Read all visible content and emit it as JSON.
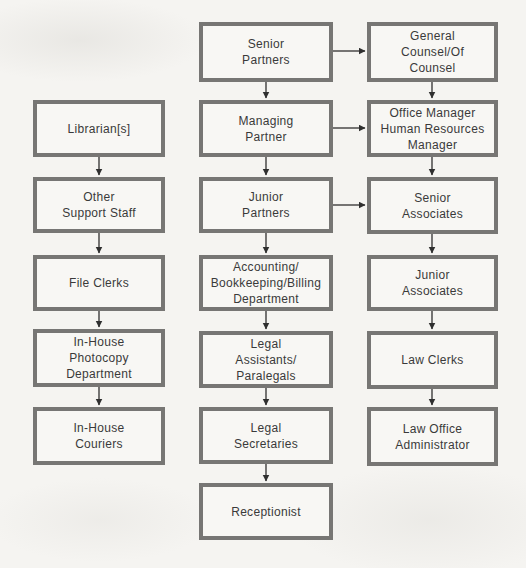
{
  "diagram": {
    "type": "org-chart",
    "colors": {
      "box_border": "#777674",
      "box_fill": "#f8f7f4",
      "text": "#3a3a3a",
      "arrow": "#2f2f2f",
      "background": "#f5f4f1"
    },
    "boxes": {
      "librarians": {
        "label": "Librarian[s]",
        "lines": [
          "Librarian[s]"
        ]
      },
      "other_support_staff": {
        "label": "Other Support Staff",
        "lines": [
          "Other",
          "Support Staff"
        ]
      },
      "file_clerks": {
        "label": "File Clerks",
        "lines": [
          "File Clerks"
        ]
      },
      "in_house_photocopy_department": {
        "label": "In-House Photocopy Department",
        "lines": [
          "In-House",
          "Photocopy",
          "Department"
        ]
      },
      "in_house_couriers": {
        "label": "In-House Couriers",
        "lines": [
          "In-House",
          "Couriers"
        ]
      },
      "senior_partners": {
        "label": "Senior Partners",
        "lines": [
          "Senior",
          "Partners"
        ]
      },
      "managing_partner": {
        "label": "Managing Partner",
        "lines": [
          "Managing",
          "Partner"
        ]
      },
      "junior_partners": {
        "label": "Junior Partners",
        "lines": [
          "Junior",
          "Partners"
        ]
      },
      "accounting_bookkeeping_billing_department": {
        "label": "Accounting/Bookkeeping/Billing Department",
        "lines": [
          "Accounting/",
          "Bookkeeping/Billing",
          "Department"
        ]
      },
      "legal_assistants_paralegals": {
        "label": "Legal Assistants/Paralegals",
        "lines": [
          "Legal",
          "Assistants/",
          "Paralegals"
        ]
      },
      "legal_secretaries": {
        "label": "Legal Secretaries",
        "lines": [
          "Legal",
          "Secretaries"
        ]
      },
      "receptionist": {
        "label": "Receptionist",
        "lines": [
          "Receptionist"
        ]
      },
      "general_counsel": {
        "label": "General Counsel/Of Counsel",
        "lines": [
          "General",
          "Counsel/Of",
          "Counsel"
        ]
      },
      "office_manager": {
        "label": "Office Manager Human Resources Manager",
        "lines": [
          "Office Manager",
          "Human Resources",
          "Manager"
        ]
      },
      "senior_associates": {
        "label": "Senior Associates",
        "lines": [
          "Senior",
          "Associates"
        ]
      },
      "junior_associates": {
        "label": "Junior Associates",
        "lines": [
          "Junior",
          "Associates"
        ]
      },
      "law_clerks": {
        "label": "Law Clerks",
        "lines": [
          "Law Clerks"
        ]
      },
      "law_office_administrator": {
        "label": "Law Office Administrator",
        "lines": [
          "Law Office",
          "Administrator"
        ]
      }
    },
    "connections": [
      {
        "from": "librarians",
        "to": "other_support_staff",
        "direction": "down"
      },
      {
        "from": "other_support_staff",
        "to": "file_clerks",
        "direction": "down"
      },
      {
        "from": "file_clerks",
        "to": "in_house_photocopy_department",
        "direction": "down"
      },
      {
        "from": "in_house_photocopy_department",
        "to": "in_house_couriers",
        "direction": "down"
      },
      {
        "from": "senior_partners",
        "to": "managing_partner",
        "direction": "down"
      },
      {
        "from": "managing_partner",
        "to": "junior_partners",
        "direction": "down"
      },
      {
        "from": "junior_partners",
        "to": "accounting_bookkeeping_billing_department",
        "direction": "down"
      },
      {
        "from": "accounting_bookkeeping_billing_department",
        "to": "legal_assistants_paralegals",
        "direction": "down"
      },
      {
        "from": "legal_assistants_paralegals",
        "to": "legal_secretaries",
        "direction": "down"
      },
      {
        "from": "legal_secretaries",
        "to": "receptionist",
        "direction": "down"
      },
      {
        "from": "general_counsel",
        "to": "office_manager",
        "direction": "down"
      },
      {
        "from": "office_manager",
        "to": "senior_associates",
        "direction": "down"
      },
      {
        "from": "senior_associates",
        "to": "junior_associates",
        "direction": "down"
      },
      {
        "from": "junior_associates",
        "to": "law_clerks",
        "direction": "down"
      },
      {
        "from": "law_clerks",
        "to": "law_office_administrator",
        "direction": "down"
      },
      {
        "from": "senior_partners",
        "to": "general_counsel",
        "direction": "right"
      },
      {
        "from": "managing_partner",
        "to": "office_manager",
        "direction": "right"
      },
      {
        "from": "junior_partners",
        "to": "senior_associates",
        "direction": "right"
      }
    ]
  }
}
